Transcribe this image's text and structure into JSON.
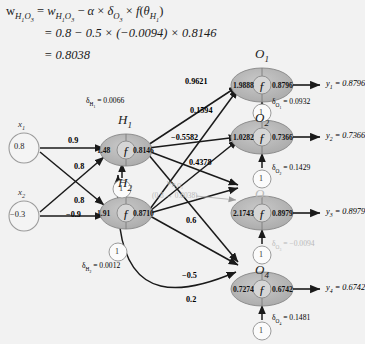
{
  "equation": {
    "line1": "w_H1O3 = w_H1O3 − α × δ_O3 × f(θ_H1)",
    "line2": "= 0.8 − 0.5 × (−0.0094) × 0.8146",
    "line3": "= 0.8038",
    "line1_lhs": "w",
    "line2_text": "= 0.8 − 0.5 × (−0.0094) × 0.8146",
    "line3_text": "= 0.8038"
  },
  "inputs": [
    {
      "name": "x",
      "sub": "1",
      "value": "0.8"
    },
    {
      "name": "x",
      "sub": "2",
      "value": "−0.3"
    }
  ],
  "hidden": [
    {
      "name": "H",
      "sub": "1",
      "net": "1.48",
      "out": "0.8146",
      "delta_label": "δ",
      "delta_sub": "H₁",
      "delta_value": "0.0066",
      "delta_text": "= 0.0066"
    },
    {
      "name": "H",
      "sub": "2",
      "net": "1.91",
      "out": "0.8710",
      "delta_label": "δ",
      "delta_sub": "H₂",
      "delta_value": "0.0012",
      "delta_text": "= 0.0012"
    }
  ],
  "outputs": [
    {
      "name": "O",
      "sub": "1",
      "net": "1.9888",
      "out": "0.8796",
      "delta_text": "= 0.0932",
      "delta_sub": "O₁",
      "y_name": "y",
      "y_sub": "1",
      "y_text": "= 0.8796",
      "dim": false
    },
    {
      "name": "O",
      "sub": "2",
      "net": "1.0282",
      "out": "0.7366",
      "delta_text": "= 0.1429",
      "delta_sub": "O₂",
      "y_name": "y",
      "y_sub": "2",
      "y_text": "= 0.7366",
      "dim": false
    },
    {
      "name": "O",
      "sub": "3",
      "net": "2.1743",
      "out": "0.8979",
      "delta_text": "= −0.0094",
      "delta_sub": "O₃",
      "y_name": "y",
      "y_sub": "3",
      "y_text": "= 0.8979",
      "dim": true
    },
    {
      "name": "O",
      "sub": "4",
      "net": "0.7274",
      "out": "0.6742",
      "delta_text": "= 0.1481",
      "delta_sub": "O₄",
      "y_name": "y",
      "y_sub": "4",
      "y_text": "= 0.6742",
      "dim": false
    }
  ],
  "input_weights": [
    "0.9",
    "0.8",
    "0.8",
    "−0.9"
  ],
  "hidden_weights": [
    "0.9621",
    "0.1594",
    "−0.5582",
    "0.4378",
    "0.6",
    "−0.5",
    "0.2"
  ],
  "annotation": {
    "name": "w",
    "sub": "H₁O₃",
    "change": "(0.8 → 0.8038)"
  },
  "bias_label": "1",
  "activation_glyph": "ƒ",
  "colors": {
    "background": "#f2f2f2",
    "node_fill": "#b3b3b3",
    "input_fill": "#f4f4f4",
    "edge": "#1a1a1a",
    "dim_text": "#b9b9b9"
  }
}
